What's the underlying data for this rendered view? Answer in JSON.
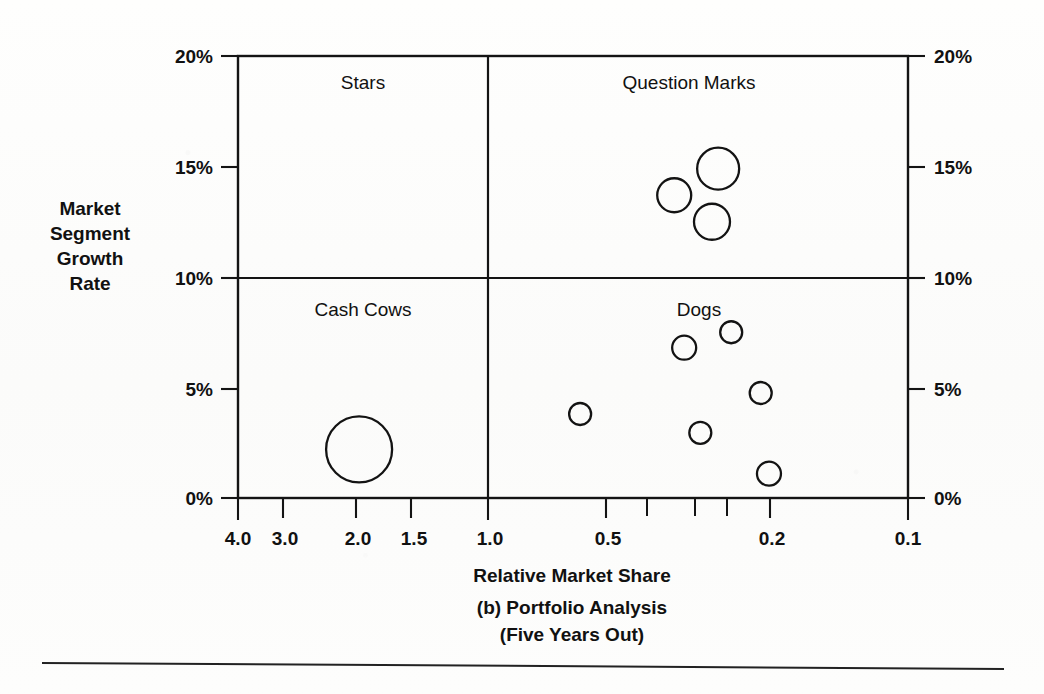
{
  "figure": {
    "caption_line1": "Relative Market Share",
    "caption_line2": "(b) Portfolio Analysis",
    "caption_line3": "(Five Years Out)"
  },
  "y_axis": {
    "title_line1": "Market",
    "title_line2": "Segment",
    "title_line3": "Growth",
    "title_line4": "Rate",
    "labels_left": [
      "20%",
      "15%",
      "10%",
      "5%",
      "0%"
    ],
    "labels_right": [
      "20%",
      "15%",
      "10%",
      "5%",
      "0%"
    ]
  },
  "x_axis": {
    "title": "Relative Market Share",
    "labels": [
      "4.0",
      "3.0",
      "2.0",
      "1.5",
      "1.0",
      "0.5",
      "0.2",
      "0.1"
    ]
  },
  "quadrants": {
    "top_left": "Stars",
    "top_right": "Question Marks",
    "bottom_left": "Cash Cows",
    "bottom_right": "Dogs"
  },
  "colors": {
    "ink": "#141414",
    "paper": "#fdfdfc"
  },
  "chart_data": {
    "type": "scatter",
    "title": "(b) Portfolio Analysis (Five Years Out)",
    "xlabel": "Relative Market Share",
    "ylabel": "Market Segment Growth Rate",
    "xscale": "log-reversed",
    "xlim": [
      4.6,
      0.088
    ],
    "ylim": [
      0,
      20
    ],
    "x_ticks": [
      4.0,
      3.0,
      2.0,
      1.5,
      1.0,
      0.5,
      0.2,
      0.1
    ],
    "x_tick_labels": [
      "4.0",
      "3.0",
      "2.0",
      "1.5",
      "1.0",
      "0.5",
      "0.2",
      "0.1"
    ],
    "x_minor_ticks": [
      0.4,
      0.3,
      0.25
    ],
    "y_ticks": [
      0,
      5,
      10,
      15,
      20
    ],
    "y_tick_labels": [
      "0%",
      "5%",
      "10%",
      "15%",
      "20%"
    ],
    "grid": false,
    "legend": "none",
    "quadrant_divider_x": 1.0,
    "quadrant_divider_y": 10,
    "quadrant_names": [
      "Stars",
      "Question Marks",
      "Cash Cows",
      "Dogs"
    ],
    "bubble_style": "open-circle",
    "points": [
      {
        "quadrant": "Cash Cows",
        "x": 2.25,
        "y": 2.2,
        "size": 33
      },
      {
        "quadrant": "Question Marks",
        "x": 0.35,
        "y": 13.7,
        "size": 17
      },
      {
        "quadrant": "Question Marks",
        "x": 0.27,
        "y": 14.9,
        "size": 21
      },
      {
        "quadrant": "Question Marks",
        "x": 0.28,
        "y": 12.5,
        "size": 18
      },
      {
        "quadrant": "Dogs",
        "x": 0.33,
        "y": 6.8,
        "size": 12
      },
      {
        "quadrant": "Dogs",
        "x": 0.25,
        "y": 7.5,
        "size": 11
      },
      {
        "quadrant": "Dogs",
        "x": 0.21,
        "y": 4.75,
        "size": 11
      },
      {
        "quadrant": "Dogs",
        "x": 0.61,
        "y": 3.8,
        "size": 11
      },
      {
        "quadrant": "Dogs",
        "x": 0.3,
        "y": 2.95,
        "size": 11
      },
      {
        "quadrant": "Dogs",
        "x": 0.2,
        "y": 1.1,
        "size": 12
      }
    ]
  }
}
